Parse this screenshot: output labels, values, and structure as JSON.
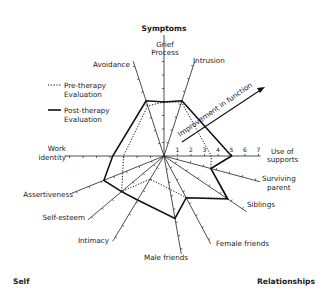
{
  "chart_data": {
    "type": "radar",
    "title": "",
    "scale": {
      "min": 0,
      "max": 7,
      "ticks": [
        1,
        2,
        3,
        4,
        5,
        6,
        7
      ],
      "tick_labels_axis": "Use of supports"
    },
    "group_labels": {
      "top": "Symptoms",
      "bottom_left": "Self",
      "bottom_right": "Relationships"
    },
    "annotation": "Improvement in function",
    "axes": [
      {
        "key": "grief",
        "label": "Grief Process",
        "angle": 90
      },
      {
        "key": "intrusion",
        "label": "Intrusion",
        "angle": 72
      },
      {
        "key": "supports",
        "label": "Use of supports",
        "angle": 0
      },
      {
        "key": "parent",
        "label": "Surviving parent",
        "angle": -15
      },
      {
        "key": "siblings",
        "label": "Siblings",
        "angle": -34
      },
      {
        "key": "female",
        "label": "Female friends",
        "angle": -62
      },
      {
        "key": "male",
        "label": "Male friends",
        "angle": -80
      },
      {
        "key": "intimacy",
        "label": "Intimacy",
        "angle": -121
      },
      {
        "key": "selfesteem",
        "label": "Self-esteem",
        "angle": -140
      },
      {
        "key": "assert",
        "label": "Assertiveness",
        "angle": -158
      },
      {
        "key": "work",
        "label": "Work identity",
        "angle": 180
      },
      {
        "key": "avoidance",
        "label": "Avoidance",
        "angle": 108
      }
    ],
    "series": [
      {
        "name": "Pre-therapy Evaluation",
        "style": "dotted",
        "values": [
          4,
          4.2,
          3.5,
          3.6,
          5.6,
          3.5,
          2.5,
          2.0,
          4.1,
          3.3,
          3.0,
          3.9
        ]
      },
      {
        "name": "Post-therapy Evaluation",
        "style": "solid",
        "values": [
          4,
          4.3,
          5,
          3.6,
          5.7,
          3.5,
          4.7,
          3.8,
          4.1,
          4.8,
          3.8,
          4.3
        ]
      }
    ],
    "legend": {
      "position": "upper-left",
      "entries": [
        "Pre-therapy Evaluation",
        "Post-therapy Evaluation"
      ]
    }
  },
  "labels": {
    "symptoms": "Symptoms",
    "self": "Self",
    "relationships": "Relationships",
    "grief_1": "Grief",
    "grief_2": "Process",
    "intrusion": "Intrusion",
    "avoidance": "Avoidance",
    "supports_1": "Use of",
    "supports_2": "supports",
    "parent_1": "Surviving",
    "parent_2": "parent",
    "siblings": "Siblings",
    "female": "Female friends",
    "male": "Male friends",
    "intimacy": "Intimacy",
    "selfesteem": "Self-esteem",
    "assert": "Assertiveness",
    "work_1": "Work",
    "work_2": "identity",
    "legend_pre_1": "Pre-therapy",
    "legend_pre_2": "Evaluation",
    "legend_post_1": "Post-therapy",
    "legend_post_2": "Evaluation",
    "annotation": "Improvement in function",
    "ticks": [
      "1",
      "2",
      "3",
      "4",
      "5",
      "6",
      "7"
    ]
  }
}
